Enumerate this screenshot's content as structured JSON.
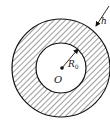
{
  "diagram": {
    "type": "annulus",
    "center_label": "O",
    "inner_radius_label": "R",
    "inner_radius_subscript": "0",
    "thickness_label": "h",
    "fill_pattern": "diagonal-hatch",
    "stroke_color": "#111111",
    "background": "#ffffff"
  }
}
